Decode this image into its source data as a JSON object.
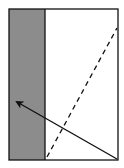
{
  "diagram": {
    "colors": {
      "background": "#ffffff",
      "shaded_region": "#8c8c8c",
      "stroke": "#111111"
    },
    "elements": [
      {
        "name": "outer-rectangle",
        "type": "rectangle"
      },
      {
        "name": "shaded-strip",
        "type": "filled-region",
        "position": "left"
      },
      {
        "name": "dashed-line",
        "type": "line",
        "style": "dashed",
        "direction": "bottom-left to top-right"
      },
      {
        "name": "arrow",
        "type": "arrow",
        "style": "solid",
        "direction": "bottom-right to upper-left"
      }
    ]
  }
}
